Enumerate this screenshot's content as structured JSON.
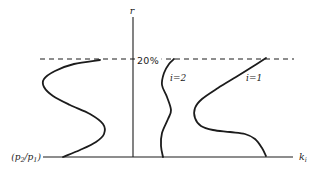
{
  "figure": {
    "background": "#ffffff",
    "ink": "#1c1c1c",
    "labels": {
      "y_axis": "r",
      "threshold": "20%",
      "mode_2": "i=2",
      "mode_1": "i=1",
      "x_axis_main": "k",
      "x_axis_sub": "i",
      "p_ratio_open": "(p",
      "p_ratio_sub2": "2",
      "p_ratio_mid": "/p",
      "p_ratio_sub1": "1",
      "p_ratio_close": ")"
    }
  },
  "chart_data": {
    "type": "line",
    "title": "",
    "xlabel": "k_i",
    "ylabel": "r",
    "qualitative": true,
    "grid": false,
    "legend": "inline curve labels",
    "annotations": [
      {
        "text": "20%",
        "kind": "dashed horizontal threshold line",
        "y_px": 59
      }
    ],
    "axes": {
      "y_axis_px": {
        "x": 133,
        "y_top": 17,
        "y_bottom": 157
      },
      "x_axis_px": {
        "y": 157,
        "x_left": 43,
        "x_right": 293
      },
      "threshold_px": {
        "y": 59,
        "x_left": 40,
        "x_right": 294
      }
    },
    "series": [
      {
        "name": "(p2/p1)",
        "display_label": "(p₂/p₁)",
        "dom_name": "curve-p2p1",
        "points_px": [
          [
            63,
            157
          ],
          [
            80,
            150
          ],
          [
            96,
            142
          ],
          [
            104,
            134
          ],
          [
            103,
            124
          ],
          [
            90,
            114
          ],
          [
            70,
            105
          ],
          [
            53,
            96
          ],
          [
            44,
            87
          ],
          [
            44,
            79
          ],
          [
            55,
            71
          ],
          [
            74,
            64
          ],
          [
            100,
            60
          ]
        ]
      },
      {
        "name": "i=2",
        "display_label": "i=2",
        "dom_name": "curve-i2",
        "points_px": [
          [
            163,
            157
          ],
          [
            161,
            146
          ],
          [
            162,
            133
          ],
          [
            168,
            119
          ],
          [
            171,
            110
          ],
          [
            167,
            97
          ],
          [
            162,
            85
          ],
          [
            164,
            73
          ],
          [
            169,
            64
          ],
          [
            174,
            59
          ]
        ]
      },
      {
        "name": "i=1",
        "display_label": "i=1",
        "dom_name": "curve-i1",
        "points_px": [
          [
            266,
            156
          ],
          [
            262,
            148
          ],
          [
            255,
            139
          ],
          [
            245,
            134
          ],
          [
            230,
            132
          ],
          [
            213,
            130
          ],
          [
            201,
            126
          ],
          [
            195,
            118
          ],
          [
            195,
            108
          ],
          [
            202,
            99
          ],
          [
            218,
            88
          ],
          [
            236,
            77
          ],
          [
            252,
            67
          ],
          [
            266,
            58
          ]
        ]
      }
    ]
  }
}
